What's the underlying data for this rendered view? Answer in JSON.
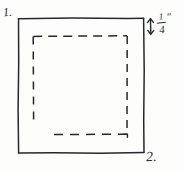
{
  "figure": {
    "type": "hand-drawn-sketch",
    "ink_color": "#25282c",
    "paper_color": "#fdfdfc"
  },
  "labels": {
    "figure_one": "1.",
    "figure_two": "2."
  },
  "dimension": {
    "arrow_icon": "double-headed-vertical-arrow",
    "numerator": "1",
    "denominator": "4",
    "unit_mark": "″",
    "full_text": "1/4\""
  },
  "shapes": {
    "outer_square": {
      "name": "solid-square-outline",
      "x": 18,
      "y": 18,
      "width": 126,
      "height": 135,
      "stroke": "#25282c",
      "style": "solid"
    },
    "inner_rect": {
      "name": "dashed-inset-rectangle",
      "x": 33,
      "y": 36,
      "width": 94,
      "height": 98,
      "stroke": "#25282c",
      "style": "dashed"
    }
  }
}
